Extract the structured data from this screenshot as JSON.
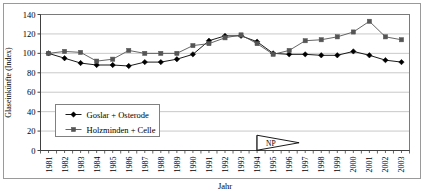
{
  "figure": {
    "bottom_caption": ""
  },
  "chart_data": {
    "type": "line",
    "title": "",
    "xlabel": "Jahr",
    "ylabel": "Glaseinkünfte (Index)",
    "ylim": [
      0,
      140
    ],
    "ytick_step": 20,
    "yticks": [
      0,
      20,
      40,
      60,
      80,
      100,
      120,
      140
    ],
    "grid": true,
    "legend_position": "lower-left-inside",
    "categories": [
      "1981",
      "1982",
      "1983",
      "1984",
      "1985",
      "1986",
      "1987",
      "1988",
      "1989",
      "1990",
      "1991",
      "1992",
      "1993",
      "1994",
      "1995",
      "1996",
      "1997",
      "1998",
      "1999",
      "2000",
      "2001",
      "2002",
      "2003"
    ],
    "series": [
      {
        "name": "Goslar + Osterode",
        "marker": "diamond",
        "color": "#000000",
        "values": [
          100,
          95,
          90,
          88,
          88,
          87,
          91,
          91,
          94,
          99,
          113,
          118,
          118,
          112,
          100,
          99,
          99,
          98,
          98,
          102,
          98,
          93,
          91
        ]
      },
      {
        "name": "Holzminden + Celle",
        "marker": "square",
        "color": "#555555",
        "values": [
          100,
          102,
          101,
          92,
          94,
          103,
          100,
          100,
          100,
          108,
          110,
          116,
          119,
          110,
          99,
          103,
          113,
          114,
          117,
          122,
          133,
          117,
          114
        ]
      }
    ],
    "annotations": [
      {
        "label": "NP",
        "type": "flag",
        "x_category": "1994",
        "y_value": 26
      }
    ]
  }
}
